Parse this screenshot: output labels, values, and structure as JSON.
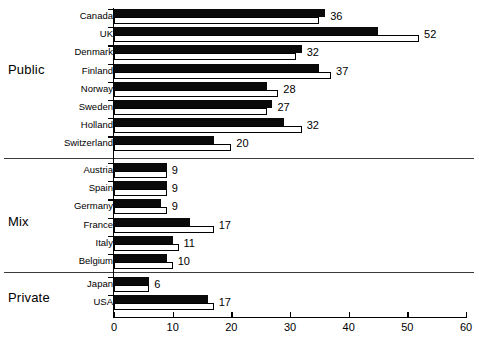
{
  "chart_data": {
    "type": "bar",
    "orientation": "horizontal",
    "title": "",
    "xlabel": "",
    "ylabel": "",
    "xlim": [
      0,
      60
    ],
    "xticks": [
      0,
      10,
      20,
      30,
      40,
      50,
      60
    ],
    "xtick_labels": [
      "0",
      "10",
      "20",
      "30",
      "40",
      "50",
      "60"
    ],
    "grid": false,
    "legend": "none",
    "series": [
      {
        "name": "black-bar",
        "style": "filled-black"
      },
      {
        "name": "white-bar",
        "style": "outlined-white"
      }
    ],
    "groups": [
      {
        "label": "Public",
        "categories": [
          "Canada",
          "UK",
          "Denmark",
          "Finland",
          "Norway",
          "Sweden",
          "Holland",
          "Switzerland"
        ],
        "black_values": [
          36,
          45,
          32,
          35,
          26,
          27,
          29,
          17
        ],
        "white_values": [
          35,
          52,
          31,
          37,
          28,
          26,
          32,
          20
        ],
        "labels": [
          "36",
          "52",
          "32",
          "37",
          "28",
          "27",
          "32",
          "20"
        ]
      },
      {
        "label": "Mix",
        "categories": [
          "Austria",
          "Spain",
          "Germany",
          "France",
          "Italy",
          "Belgium"
        ],
        "black_values": [
          9,
          9,
          8,
          13,
          10,
          9
        ],
        "white_values": [
          9,
          9,
          9,
          17,
          11,
          10
        ],
        "labels": [
          "9",
          "9",
          "9",
          "17",
          "11",
          "10"
        ]
      },
      {
        "label": "Private",
        "categories": [
          "Japan",
          "USA"
        ],
        "black_values": [
          6,
          16
        ],
        "white_values": [
          6,
          17
        ],
        "labels": [
          "6",
          "17"
        ]
      }
    ],
    "categories": [
      "Canada",
      "UK",
      "Denmark",
      "Finland",
      "Norway",
      "Sweden",
      "Holland",
      "Switzerland",
      "Austria",
      "Spain",
      "Germany",
      "France",
      "Italy",
      "Belgium",
      "Japan",
      "USA"
    ],
    "values": [
      36,
      52,
      32,
      37,
      28,
      27,
      32,
      20,
      9,
      9,
      9,
      17,
      11,
      10,
      6,
      17
    ]
  },
  "axis": {
    "x_tick_labels": [
      "0",
      "10",
      "20",
      "30",
      "40",
      "50",
      "60"
    ]
  },
  "groups": {
    "public": "Public",
    "mix": "Mix",
    "private": "Private"
  },
  "rows": [
    {
      "name": "Canada",
      "value": "36"
    },
    {
      "name": "UK",
      "value": "52"
    },
    {
      "name": "Denmark",
      "value": "32"
    },
    {
      "name": "Finland",
      "value": "37"
    },
    {
      "name": "Norway",
      "value": "28"
    },
    {
      "name": "Sweden",
      "value": "27"
    },
    {
      "name": "Holland",
      "value": "32"
    },
    {
      "name": "Switzerland",
      "value": "20"
    },
    {
      "name": "Austria",
      "value": "9"
    },
    {
      "name": "Spain",
      "value": "9"
    },
    {
      "name": "Germany",
      "value": "9"
    },
    {
      "name": "France",
      "value": "17"
    },
    {
      "name": "Italy",
      "value": "11"
    },
    {
      "name": "Belgium",
      "value": "10"
    },
    {
      "name": "Japan",
      "value": "6"
    },
    {
      "name": "USA",
      "value": "17"
    }
  ],
  "colors": {
    "bar_filled": "#0a0a0a",
    "bar_outline": "#000000",
    "bar_face": "#ffffff",
    "axis": "#000000",
    "separator": "#3a3a3a",
    "background": "#ffffff",
    "text": "#000000"
  }
}
